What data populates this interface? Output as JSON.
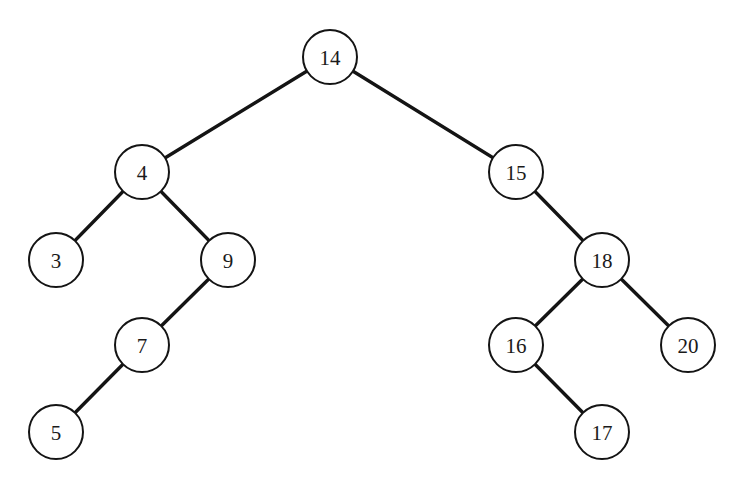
{
  "diagram": {
    "type": "binary-search-tree",
    "colors": {
      "background": "#ffffff",
      "stroke": "#141414",
      "text": "#1a1a1a"
    },
    "node_radius": 27,
    "nodes": [
      {
        "id": "n14",
        "label": "14",
        "x": 330,
        "y": 57
      },
      {
        "id": "n4",
        "label": "4",
        "x": 142,
        "y": 172
      },
      {
        "id": "n15",
        "label": "15",
        "x": 516,
        "y": 172
      },
      {
        "id": "n3",
        "label": "3",
        "x": 56,
        "y": 260
      },
      {
        "id": "n9",
        "label": "9",
        "x": 228,
        "y": 260
      },
      {
        "id": "n18",
        "label": "18",
        "x": 602,
        "y": 260
      },
      {
        "id": "n7",
        "label": "7",
        "x": 142,
        "y": 345
      },
      {
        "id": "n16",
        "label": "16",
        "x": 516,
        "y": 345
      },
      {
        "id": "n20",
        "label": "20",
        "x": 688,
        "y": 345
      },
      {
        "id": "n5",
        "label": "5",
        "x": 56,
        "y": 432
      },
      {
        "id": "n17",
        "label": "17",
        "x": 602,
        "y": 432
      }
    ],
    "edges": [
      {
        "from": "n14",
        "to": "n4"
      },
      {
        "from": "n14",
        "to": "n15"
      },
      {
        "from": "n4",
        "to": "n3"
      },
      {
        "from": "n4",
        "to": "n9"
      },
      {
        "from": "n9",
        "to": "n7"
      },
      {
        "from": "n7",
        "to": "n5"
      },
      {
        "from": "n15",
        "to": "n18"
      },
      {
        "from": "n18",
        "to": "n16"
      },
      {
        "from": "n18",
        "to": "n20"
      },
      {
        "from": "n16",
        "to": "n17"
      }
    ]
  }
}
